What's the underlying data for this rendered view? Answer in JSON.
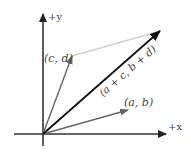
{
  "diagram": {
    "axes": {
      "x_label": "+x",
      "y_label": "+y"
    },
    "vectors": [
      {
        "name": "v1",
        "label": "(a, b)",
        "color": "#666666"
      },
      {
        "name": "v2",
        "label": "(c, d)",
        "color": "#666666"
      },
      {
        "name": "sum",
        "label": "(a + c, b + d)",
        "color": "#111111"
      }
    ],
    "helper_line": {
      "from": "(c, d)",
      "to": "(a + c, b + d)",
      "color": "#c8c8c8"
    }
  }
}
